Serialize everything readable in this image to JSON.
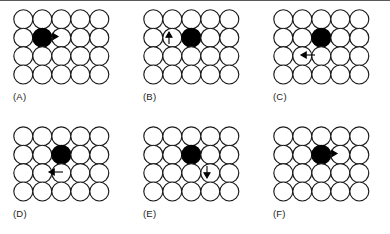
{
  "figure": {
    "type": "diagram",
    "background_color": "#ffffff",
    "open_circle_fill": "#ffffff",
    "open_circle_stroke": "#1a1a1a",
    "filled_circle_color": "#000000",
    "arrow_color": "#000000",
    "grid": {
      "columns": 5,
      "rows": 4,
      "circle_radius": 9.5,
      "x_step": 19,
      "y_step": 18.4,
      "row_offsets": [
        0,
        0,
        0,
        0
      ]
    },
    "panels": [
      {
        "id": "A",
        "label": "(A)",
        "filled_circle": {
          "row": 2,
          "col": 2
        },
        "arrow": {
          "direction": "right",
          "glyph": "arrow-right",
          "start": {
            "x": 31,
            "y": 27.5
          },
          "end": {
            "x": 45,
            "y": 27.5
          }
        }
      },
      {
        "id": "B",
        "label": "(B)",
        "filled_circle": {
          "row": 2,
          "col": 3
        },
        "arrow": {
          "direction": "up",
          "glyph": "arrow-up",
          "start": {
            "x": 26,
            "y": 35
          },
          "end": {
            "x": 26,
            "y": 23
          }
        }
      },
      {
        "id": "C",
        "label": "(C)",
        "filled_circle": {
          "row": 2,
          "col": 3
        },
        "arrow": {
          "direction": "left",
          "glyph": "arrow-left",
          "start": {
            "x": 42,
            "y": 46
          },
          "end": {
            "x": 28,
            "y": 46
          }
        }
      },
      {
        "id": "D",
        "label": "(D)",
        "filled_circle": {
          "row": 2,
          "col": 3
        },
        "arrow": {
          "direction": "left",
          "glyph": "arrow-left",
          "start": {
            "x": 50,
            "y": 46
          },
          "end": {
            "x": 36,
            "y": 46
          }
        }
      },
      {
        "id": "E",
        "label": "(E)",
        "filled_circle": {
          "row": 2,
          "col": 3
        },
        "arrow": {
          "direction": "down",
          "glyph": "arrow-down",
          "start": {
            "x": 64,
            "y": 40
          },
          "end": {
            "x": 64,
            "y": 52
          }
        }
      },
      {
        "id": "F",
        "label": "(F)",
        "filled_circle": {
          "row": 2,
          "col": 3
        },
        "arrow": {
          "direction": "right",
          "glyph": "arrow-right",
          "start": {
            "x": 50,
            "y": 27.5
          },
          "end": {
            "x": 64,
            "y": 27.5
          }
        }
      }
    ]
  }
}
